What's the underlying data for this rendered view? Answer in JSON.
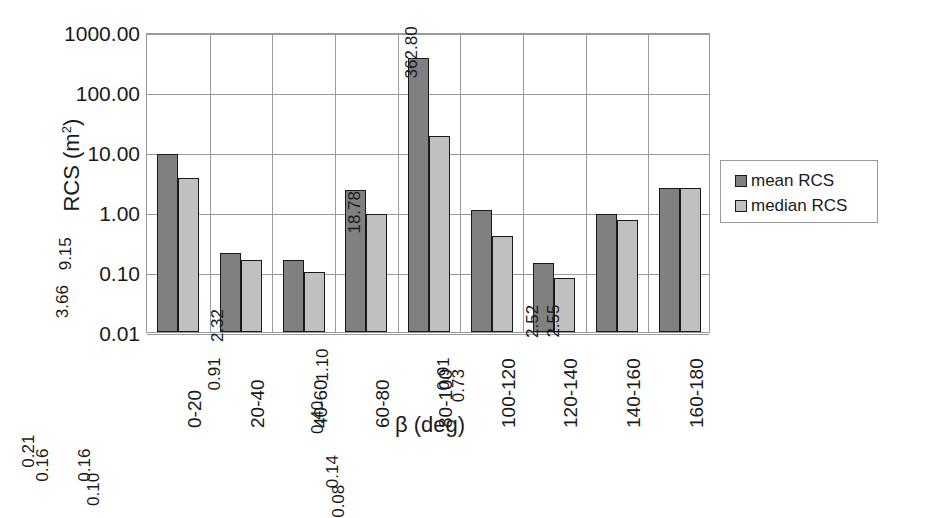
{
  "chart_data": {
    "type": "bar",
    "title": "",
    "subtitle": "",
    "xlabel": "β (deg)",
    "ylabel": "RCS (m²)",
    "ylabel_base": "RCS (m",
    "ylabel_sup": "2",
    "ylabel_close": ")",
    "yscale": "log",
    "ylim": [
      0.01,
      1000
    ],
    "ytick_labels": [
      "1000.00",
      "100.00",
      "10.00",
      "1.00",
      "0.10",
      "0.01"
    ],
    "ytick_values": [
      1000,
      100,
      10,
      1,
      0.1,
      0.01
    ],
    "grid": true,
    "grid_axis": "both",
    "legend_position": "right",
    "categories": [
      "0-20",
      "20-40",
      "40-60",
      "60-80",
      "80-100",
      "100-120",
      "120-140",
      "140-160",
      "160-180"
    ],
    "series": [
      {
        "name": "mean RCS",
        "color": "#808080",
        "values": [
          9.15,
          0.21,
          0.16,
          2.32,
          362.8,
          1.1,
          0.14,
          0.91,
          2.52
        ],
        "labels": [
          "9.15",
          "0.21",
          "0.16",
          "2.32",
          "362.80",
          "1.10",
          "0.14",
          "0.91",
          "2.52"
        ]
      },
      {
        "name": "median RCS",
        "color": "#c0c0c0",
        "values": [
          3.66,
          0.16,
          0.1,
          0.91,
          18.78,
          0.4,
          0.08,
          0.73,
          2.55
        ],
        "labels": [
          "3.66",
          "0.16",
          "0.10",
          "0.91",
          "18.78",
          "0.40",
          "0.08",
          "0.73",
          "2.55"
        ]
      }
    ]
  },
  "legend": {
    "entries": [
      {
        "label": "mean RCS",
        "color": "#808080"
      },
      {
        "label": "median RCS",
        "color": "#c0c0c0"
      }
    ]
  }
}
